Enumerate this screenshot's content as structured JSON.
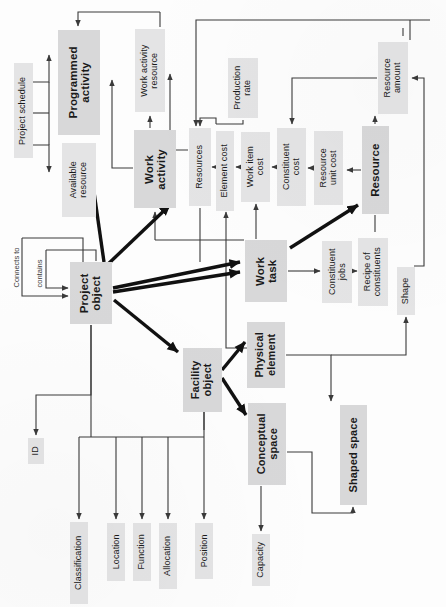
{
  "diagram": {
    "orientation": "rotated-90",
    "colors": {
      "node_fill": "#dededf",
      "node_fill_bold": "#d8d8d9",
      "line": "#3a3a3a",
      "thick_line": "#111111",
      "background": "#fdfdfd"
    },
    "nodes": [
      {
        "id": "project_schedule",
        "label": "Project schedule",
        "x": 14,
        "y": 63,
        "w": 19,
        "h": 95,
        "bold": false,
        "fs": 9
      },
      {
        "id": "programmed_activity",
        "label": "Programmed\nactivity",
        "x": 58,
        "y": 30,
        "w": 42,
        "h": 105,
        "bold": true,
        "fs": 11.5
      },
      {
        "id": "available_resource",
        "label": "Available\nresource",
        "x": 62,
        "y": 143,
        "w": 34,
        "h": 74,
        "bold": false,
        "fs": 9
      },
      {
        "id": "work_activity_res",
        "label": "Work activity\nresource",
        "x": 135,
        "y": 29,
        "w": 30,
        "h": 83,
        "bold": false,
        "fs": 9
      },
      {
        "id": "work_activity",
        "label": "Work\nactivity",
        "x": 134,
        "y": 130,
        "w": 42,
        "h": 78,
        "bold": true,
        "fs": 11.5
      },
      {
        "id": "production_rate",
        "label": "Production\nrate",
        "x": 228,
        "y": 58,
        "w": 30,
        "h": 60,
        "bold": false,
        "fs": 9
      },
      {
        "id": "resources",
        "label": "Resources",
        "x": 189,
        "y": 128,
        "w": 22,
        "h": 78,
        "bold": false,
        "fs": 9
      },
      {
        "id": "element_cost",
        "label": "Element cost",
        "x": 216,
        "y": 131,
        "w": 18,
        "h": 80,
        "bold": false,
        "fs": 9
      },
      {
        "id": "work_item_cost",
        "label": "Work item\ncost",
        "x": 241,
        "y": 132,
        "w": 29,
        "h": 70,
        "bold": false,
        "fs": 9
      },
      {
        "id": "constituent_cost",
        "label": "Constituent\ncost",
        "x": 277,
        "y": 128,
        "w": 29,
        "h": 78,
        "bold": false,
        "fs": 9
      },
      {
        "id": "resource_unit_cost",
        "label": "Resource\nunit cost",
        "x": 314,
        "y": 131,
        "w": 29,
        "h": 74,
        "bold": false,
        "fs": 9
      },
      {
        "id": "resource",
        "label": "Resource",
        "x": 362,
        "y": 126,
        "w": 27,
        "h": 88,
        "bold": true,
        "fs": 11.5
      },
      {
        "id": "resource_amount",
        "label": "Resource\namount",
        "x": 378,
        "y": 42,
        "w": 30,
        "h": 72,
        "bold": false,
        "fs": 9
      },
      {
        "id": "work_task",
        "label": "Work\ntask",
        "x": 245,
        "y": 240,
        "w": 42,
        "h": 62,
        "bold": true,
        "fs": 11.5
      },
      {
        "id": "constituent_jobs",
        "label": "Constituent\njobs",
        "x": 322,
        "y": 241,
        "w": 30,
        "h": 62,
        "bold": false,
        "fs": 9
      },
      {
        "id": "recipe_constituents",
        "label": "Recipe of\nconstituents",
        "x": 358,
        "y": 238,
        "w": 30,
        "h": 68,
        "bold": false,
        "fs": 9
      },
      {
        "id": "shape",
        "label": "Shape",
        "x": 397,
        "y": 267,
        "w": 18,
        "h": 48,
        "bold": false,
        "fs": 9
      },
      {
        "id": "project_object",
        "label": "Project\nobject",
        "x": 70,
        "y": 262,
        "w": 42,
        "h": 62,
        "bold": true,
        "fs": 11.5
      },
      {
        "id": "facility_object",
        "label": "Facility\nobject",
        "x": 183,
        "y": 348,
        "w": 39,
        "h": 64,
        "bold": true,
        "fs": 11
      },
      {
        "id": "physical_element",
        "label": "Physical\nelement",
        "x": 247,
        "y": 322,
        "w": 38,
        "h": 66,
        "bold": true,
        "fs": 11
      },
      {
        "id": "conceptual_space",
        "label": "Conceptual\nspace",
        "x": 248,
        "y": 403,
        "w": 38,
        "h": 82,
        "bold": true,
        "fs": 11
      },
      {
        "id": "shaped_space",
        "label": "Shaped space",
        "x": 340,
        "y": 405,
        "w": 27,
        "h": 100,
        "bold": true,
        "fs": 11
      },
      {
        "id": "capacity",
        "label": "Capacity",
        "x": 252,
        "y": 534,
        "w": 18,
        "h": 52,
        "bold": false,
        "fs": 9
      },
      {
        "id": "id",
        "label": "ID",
        "x": 28,
        "y": 438,
        "w": 16,
        "h": 26,
        "bold": false,
        "fs": 9
      },
      {
        "id": "classification",
        "label": "Classification",
        "x": 70,
        "y": 522,
        "w": 18,
        "h": 82,
        "bold": false,
        "fs": 9
      },
      {
        "id": "location",
        "label": "Location",
        "x": 107,
        "y": 523,
        "w": 18,
        "h": 58,
        "bold": false,
        "fs": 9
      },
      {
        "id": "function",
        "label": "Function",
        "x": 133,
        "y": 523,
        "w": 18,
        "h": 58,
        "bold": false,
        "fs": 9
      },
      {
        "id": "allocation",
        "label": "Allocation",
        "x": 159,
        "y": 523,
        "w": 18,
        "h": 66,
        "bold": false,
        "fs": 9
      },
      {
        "id": "position",
        "label": "Position",
        "x": 195,
        "y": 523,
        "w": 18,
        "h": 56,
        "bold": false,
        "fs": 9
      }
    ],
    "edge_labels": [
      {
        "id": "connects_to",
        "label": "Connects to",
        "x": 10,
        "y": 236,
        "w": 12,
        "h": 62
      },
      {
        "id": "contains",
        "label": "contains",
        "x": 34,
        "y": 248,
        "w": 12,
        "h": 50
      }
    ]
  }
}
